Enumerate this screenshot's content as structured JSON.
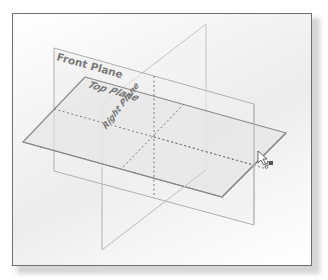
{
  "viewport": {
    "name": "graphics-area",
    "background_gradient": [
      "#ffffff",
      "#ececec"
    ],
    "border_color": "#6e6e6e"
  },
  "planes": [
    {
      "id": "front",
      "label": "Front Plane",
      "stroke": "#a8a8a8",
      "fill": "#f0f0f0"
    },
    {
      "id": "top",
      "label": "Top Plane",
      "stroke": "#8c8c8c",
      "fill": "#e6e6e6"
    },
    {
      "id": "right",
      "label": "Right Plane",
      "stroke": "#bdbdbd",
      "fill": "#efefef"
    }
  ],
  "hidden_edge_color": "#7c7c7c",
  "cursor": {
    "type": "select-pointer-with-plane",
    "icon": "arrow-cursor-icon"
  }
}
